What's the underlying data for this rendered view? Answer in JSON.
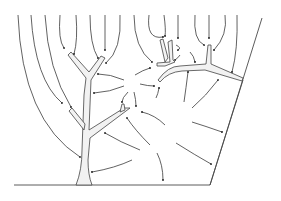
{
  "figure": {
    "title": "",
    "colors": {
      "line": "#3a3a3a",
      "channel_fill": "#f2f2f2",
      "background": "#ffffff"
    },
    "labels": []
  }
}
